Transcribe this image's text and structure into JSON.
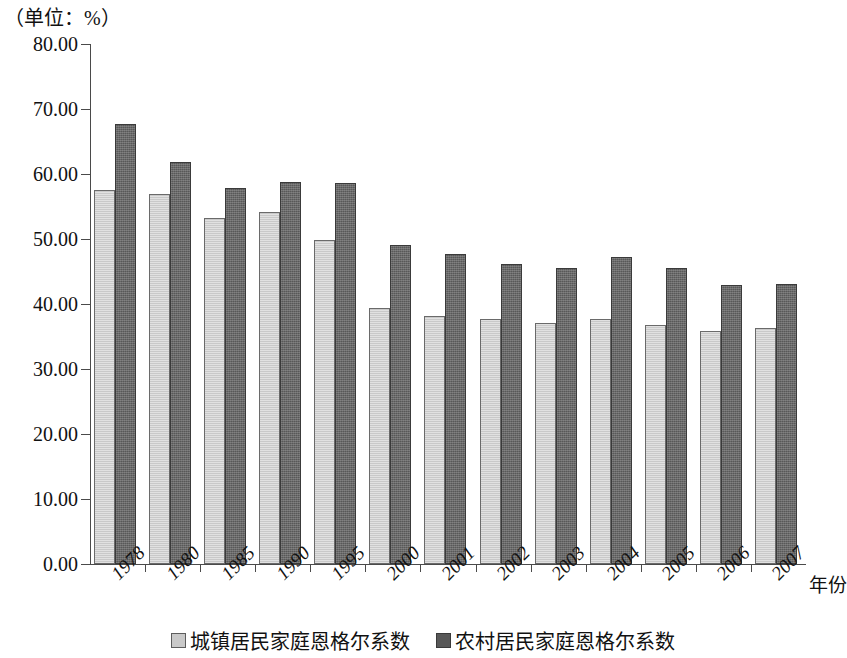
{
  "unit_caption": "（单位：%）",
  "x_axis_title": "年份",
  "legend": [
    {
      "key": "urban",
      "label": "城镇居民家庭恩格尔系数",
      "color": "#c9c9c9"
    },
    {
      "key": "rural",
      "label": "农村居民家庭恩格尔系数",
      "color": "#585858"
    }
  ],
  "chart_data": {
    "type": "bar",
    "title": "",
    "subtitle": "",
    "unit": "%",
    "xlabel": "年份",
    "ylabel": "",
    "ylim": [
      0,
      80
    ],
    "ytick_step": 10,
    "ytick_labels": [
      "80.00",
      "70.00",
      "60.00",
      "50.00",
      "40.00",
      "30.00",
      "20.00",
      "10.00",
      "0.00"
    ],
    "ytick_values": [
      80,
      70,
      60,
      50,
      40,
      30,
      20,
      10,
      0
    ],
    "grid": false,
    "legend_position": "bottom",
    "categories": [
      "1978",
      "1980",
      "1985",
      "1990",
      "1995",
      "2000",
      "2001",
      "2002",
      "2003",
      "2004",
      "2005",
      "2006",
      "2007"
    ],
    "series": [
      {
        "name": "城镇居民家庭恩格尔系数",
        "color": "#c9c9c9",
        "values": [
          57.5,
          56.9,
          53.3,
          54.2,
          49.9,
          39.4,
          38.2,
          37.7,
          37.1,
          37.7,
          36.7,
          35.8,
          36.3
        ]
      },
      {
        "name": "农村居民家庭恩格尔系数",
        "color": "#585858",
        "values": [
          67.7,
          61.8,
          57.8,
          58.8,
          58.6,
          49.1,
          47.7,
          46.2,
          45.6,
          47.2,
          45.5,
          43.0,
          43.1
        ]
      }
    ]
  }
}
